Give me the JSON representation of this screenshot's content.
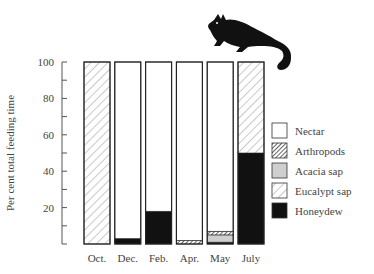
{
  "chart_data": {
    "type": "bar",
    "stacked": true,
    "title": "",
    "xlabel": "",
    "ylabel": "Per cent total feeding time",
    "ylim": [
      0,
      100
    ],
    "yticks": [
      20,
      40,
      60,
      80,
      100
    ],
    "grid": false,
    "legend_position": "right",
    "categories": [
      "Oct.",
      "Dec.",
      "Feb.",
      "Apr.",
      "May",
      "July"
    ],
    "series": [
      {
        "name": "Honeydew",
        "pattern": "solid-black",
        "values": [
          0,
          3,
          18,
          0,
          1,
          50
        ]
      },
      {
        "name": "Acacia sap",
        "pattern": "grey",
        "values": [
          0,
          0,
          0,
          0,
          4,
          0
        ]
      },
      {
        "name": "Arthropods",
        "pattern": "dense-hatch",
        "values": [
          0,
          0,
          0,
          2,
          2,
          0
        ]
      },
      {
        "name": "Eucalypt sap",
        "pattern": "light-hatch",
        "values": [
          100,
          0,
          0,
          0,
          0,
          50
        ]
      },
      {
        "name": "Nectar",
        "pattern": "white",
        "values": [
          0,
          97,
          82,
          98,
          93,
          0
        ]
      }
    ],
    "legend_order": [
      "Nectar",
      "Arthropods",
      "Acacia sap",
      "Eucalypt sap",
      "Honeydew"
    ]
  },
  "illustration": {
    "icon": "glider-silhouette-icon"
  }
}
